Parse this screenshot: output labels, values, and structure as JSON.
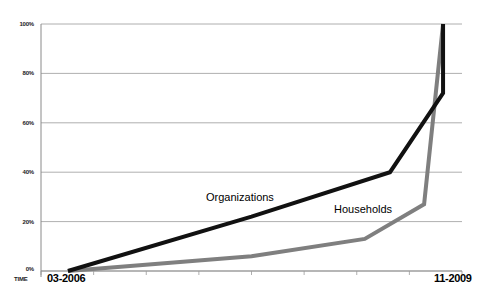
{
  "chart_data": {
    "type": "line",
    "title": "",
    "xlabel": "TIME",
    "ylabel": "",
    "grid": true,
    "legend_position": "inline-annotations",
    "ylim": [
      0,
      100
    ],
    "yticks": [
      "0%",
      "20%",
      "40%",
      "60%",
      "80%",
      "100%"
    ],
    "ytick_values": [
      0,
      20,
      40,
      60,
      80,
      100
    ],
    "x_start_label": "03-2006",
    "x_end_label": "11-2009",
    "xticks": [
      "03-2006",
      "11-2009"
    ],
    "series": [
      {
        "name": "Organizations",
        "color": "#111111",
        "x": [
          "03-2006",
          "",
          "",
          "11-2009",
          "11-2009"
        ],
        "x_frac": [
          0.064,
          0.5,
          0.829,
          0.955,
          0.955
        ],
        "values": [
          0,
          22,
          40,
          72,
          100
        ]
      },
      {
        "name": "Households",
        "color": "#7f7f7f",
        "x": [
          "03-2006",
          "",
          "",
          "11-2009",
          "11-2009"
        ],
        "x_frac": [
          0.064,
          0.5,
          0.769,
          0.91,
          0.955
        ],
        "values": [
          0,
          6,
          13,
          27,
          100
        ]
      }
    ],
    "annotations": [
      {
        "text": "Organizations",
        "x_frac": 0.42,
        "y_value": 27
      },
      {
        "text": "Households",
        "x_frac": 0.67,
        "y_value": 21
      }
    ]
  },
  "axis": {
    "time_caption": "TIME"
  }
}
